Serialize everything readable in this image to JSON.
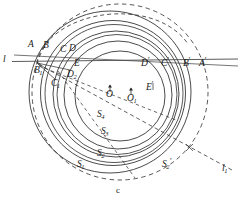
{
  "figure": {
    "caption": "c",
    "colors": {
      "stroke": "#2b2b2b",
      "background": "#ffffff",
      "dashed_stroke": "#2b2b2b"
    },
    "line_labels": [
      {
        "id": "line-l",
        "text": "l",
        "sub": "",
        "sup": "",
        "x": 3,
        "y": 57
      },
      {
        "id": "line-l1",
        "text": "l",
        "sub": "1",
        "sup": "",
        "x": 222,
        "y": 168
      }
    ],
    "intersection_labels_left": [
      {
        "id": "point-A",
        "text": "A",
        "sub": "",
        "sup": "",
        "x": 28,
        "y": 43
      },
      {
        "id": "point-B",
        "text": "B",
        "sub": "",
        "sup": "",
        "x": 43,
        "y": 44
      },
      {
        "id": "point-C",
        "text": "C",
        "sub": "",
        "sup": "",
        "x": 60,
        "y": 48
      },
      {
        "id": "point-D",
        "text": "D",
        "sub": "",
        "sup": "",
        "x": 69,
        "y": 47
      },
      {
        "id": "point-E",
        "text": "E",
        "sub": "",
        "sup": "",
        "x": 74,
        "y": 62
      },
      {
        "id": "point-B1",
        "text": "B",
        "sub": "1",
        "sup": "",
        "x": 34,
        "y": 69
      },
      {
        "id": "point-C1",
        "text": "C",
        "sub": "1",
        "sup": "",
        "x": 51,
        "y": 82
      },
      {
        "id": "point-D2",
        "text": "D",
        "sub": "2",
        "sup": "",
        "x": 67,
        "y": 73
      }
    ],
    "intersection_labels_right": [
      {
        "id": "point-D-prime",
        "text": "D",
        "sub": "",
        "sup": "'",
        "x": 141,
        "y": 62
      },
      {
        "id": "point-C-prime",
        "text": "C",
        "sub": "",
        "sup": "'",
        "x": 161,
        "y": 62
      },
      {
        "id": "point-B-prime",
        "text": "B",
        "sub": "",
        "sup": "'",
        "x": 183,
        "y": 62
      },
      {
        "id": "point-A-prime",
        "text": "A",
        "sub": "",
        "sup": "'",
        "x": 199,
        "y": 62
      }
    ],
    "center_labels": [
      {
        "id": "center-O",
        "text": "O",
        "sub": "",
        "sup": "",
        "x": 107,
        "y": 86
      },
      {
        "id": "center-O1",
        "text": "O",
        "sub": "1",
        "sup": "",
        "x": 128,
        "y": 90
      },
      {
        "id": "point-E-prime",
        "text": "E",
        "sub": "",
        "sup": "'",
        "x": 146,
        "y": 84
      }
    ],
    "arc_labels": [
      {
        "id": "arc-S4",
        "text": "S",
        "sub": "4",
        "sup": "",
        "x": 97,
        "y": 113
      },
      {
        "id": "arc-S3",
        "text": "S",
        "sub": "3",
        "sup": "",
        "x": 101,
        "y": 130
      },
      {
        "id": "arc-S2",
        "text": "S",
        "sub": "2",
        "sup": "",
        "x": 97,
        "y": 152
      },
      {
        "id": "arc-S1",
        "text": "S",
        "sub": "1",
        "sup": "",
        "x": 77,
        "y": 163
      },
      {
        "id": "arc-S2-prime",
        "text": "S",
        "sub": "2",
        "sup": "'",
        "x": 162,
        "y": 163
      }
    ],
    "geometry": {
      "horizontal_line_y": 62,
      "center_O": {
        "x": 110,
        "y": 92
      },
      "center_O1": {
        "x": 131,
        "y": 95
      },
      "solid_circles": [
        {
          "name": "S1",
          "cx": 110,
          "cy": 92,
          "r": 81
        },
        {
          "name": "S2",
          "cx": 113,
          "cy": 93,
          "r": 72
        },
        {
          "name": "S3",
          "cx": 115,
          "cy": 94,
          "r": 64
        },
        {
          "name": "S4",
          "cx": 117,
          "cy": 95,
          "r": 55
        },
        {
          "name": "S5",
          "cx": 119,
          "cy": 96,
          "r": 46
        }
      ],
      "dashed_circle": {
        "name": "S2p",
        "cx": 120,
        "cy": 92,
        "r": 88
      }
    }
  }
}
